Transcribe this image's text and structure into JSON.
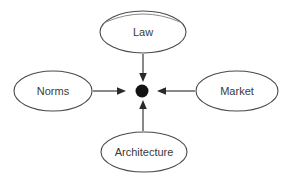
{
  "diagram": {
    "background_color": "#ffffff",
    "stroke_color": "#4a4a4a",
    "text_color": "#3a3a3a",
    "dot_color": "#121212",
    "center": {
      "label": "regulated-dot",
      "x": 142,
      "y": 91,
      "radius": 6.5
    },
    "nodes": [
      {
        "id": "law",
        "label": "Law",
        "position": "top",
        "cx": 143,
        "cy": 32,
        "rx": 43,
        "ry": 21
      },
      {
        "id": "norms",
        "label": "Norms",
        "position": "left",
        "cx": 53,
        "cy": 91,
        "rx": 39,
        "ry": 20
      },
      {
        "id": "market",
        "label": "Market",
        "position": "right",
        "cx": 237,
        "cy": 91,
        "rx": 41,
        "ry": 20
      },
      {
        "id": "architecture",
        "label": "Architecture",
        "position": "bottom",
        "cx": 144,
        "cy": 152,
        "rx": 43,
        "ry": 20
      }
    ],
    "arrows": [
      {
        "id": "law-to-dot",
        "from": "law",
        "to": "center",
        "direction": "down"
      },
      {
        "id": "norms-to-dot",
        "from": "norms",
        "to": "center",
        "direction": "right"
      },
      {
        "id": "market-to-dot",
        "from": "market",
        "to": "center",
        "direction": "left"
      },
      {
        "id": "architecture-to-dot",
        "from": "architecture",
        "to": "center",
        "direction": "up"
      }
    ]
  }
}
